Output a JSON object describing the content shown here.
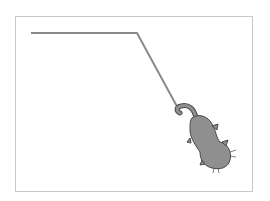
{
  "stage": {
    "background": "#ffffff",
    "border_color": "#c8c8c8"
  },
  "pen_path": {
    "color": "#8a8a8a",
    "width": 2,
    "points": [
      [
        31,
        33
      ],
      [
        137,
        33
      ],
      [
        180,
        112
      ]
    ]
  },
  "sprite": {
    "name": "cat",
    "color": "#8f8f8f",
    "outline": "#4a4a4a"
  }
}
